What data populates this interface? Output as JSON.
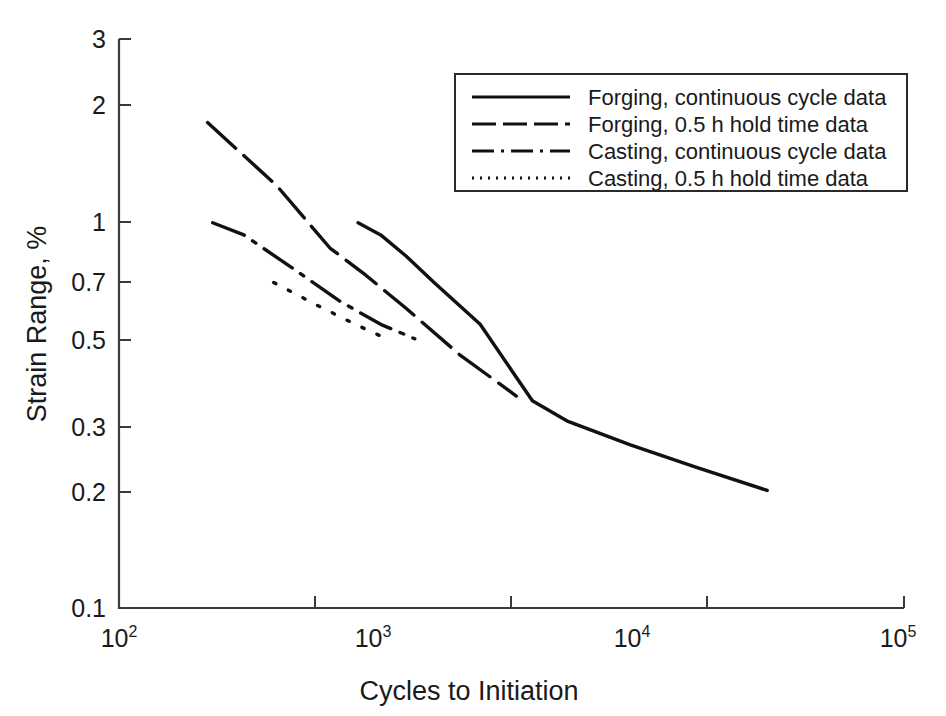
{
  "chart_data": {
    "type": "line",
    "title": "",
    "xlabel": "Cycles to Initiation",
    "ylabel": "Strain Range, %",
    "xscale": "log",
    "yscale": "log",
    "xlim": [
      100,
      100000
    ],
    "ylim": [
      0.1,
      3
    ],
    "grid": false,
    "legend_position": "top-right",
    "xticks": [
      {
        "value": 100,
        "base": "10",
        "exp": "2"
      },
      {
        "value": 1000,
        "base": "10",
        "exp": "3"
      },
      {
        "value": 10000,
        "base": "10",
        "exp": "4"
      },
      {
        "value": 100000,
        "base": "10",
        "exp": "5"
      }
    ],
    "yticks": [
      {
        "value": 3,
        "label": "3"
      },
      {
        "value": 2,
        "label": "2"
      },
      {
        "value": 1,
        "label": "1"
      },
      {
        "value": 0.7,
        "label": "0.7"
      },
      {
        "value": 0.5,
        "label": "0.5"
      },
      {
        "value": 0.3,
        "label": "0.3"
      },
      {
        "value": 0.2,
        "label": "0.2"
      },
      {
        "value": 0.1,
        "label": "0.1"
      }
    ],
    "series": [
      {
        "name": "Forging, continuous cycle data",
        "style": "solid",
        "dasharray": "none",
        "color": "#111111",
        "points": [
          [
            820,
            1.0
          ],
          [
            1000,
            0.93
          ],
          [
            1250,
            0.82
          ],
          [
            1600,
            0.7
          ],
          [
            2400,
            0.545
          ],
          [
            3800,
            0.345
          ],
          [
            5200,
            0.305
          ],
          [
            9000,
            0.265
          ],
          [
            16000,
            0.232
          ],
          [
            30000,
            0.202
          ]
        ]
      },
      {
        "name": "Forging, 0.5 h hold time data",
        "style": "dashed",
        "dasharray": "38,11",
        "color": "#111111",
        "points": [
          [
            218,
            1.82
          ],
          [
            400,
            1.25
          ],
          [
            640,
            0.86
          ],
          [
            880,
            0.73
          ],
          [
            1250,
            0.6
          ],
          [
            2000,
            0.455
          ],
          [
            3300,
            0.355
          ]
        ]
      },
      {
        "name": "Casting, continuous cycle data",
        "style": "dashdot",
        "dasharray": "34,10,4,10",
        "color": "#111111",
        "points": [
          [
            228,
            1.0
          ],
          [
            300,
            0.93
          ],
          [
            470,
            0.755
          ],
          [
            700,
            0.625
          ],
          [
            1000,
            0.545
          ],
          [
            1350,
            0.5
          ]
        ]
      },
      {
        "name": "Casting, 0.5 h hold time data",
        "style": "dotted",
        "dasharray": "2.5,14",
        "color": "#111111",
        "points": [
          [
            390,
            0.7
          ],
          [
            560,
            0.615
          ],
          [
            800,
            0.545
          ],
          [
            1020,
            0.505
          ]
        ]
      }
    ]
  },
  "legend": {
    "entries": [
      {
        "label": "Forging, continuous cycle data",
        "style": "solid"
      },
      {
        "label": "Forging, 0.5 h hold time data",
        "style": "dashed"
      },
      {
        "label": "Casting, continuous cycle data",
        "style": "dashdot"
      },
      {
        "label": "Casting, 0.5 h hold time data",
        "style": "dotted"
      }
    ]
  }
}
